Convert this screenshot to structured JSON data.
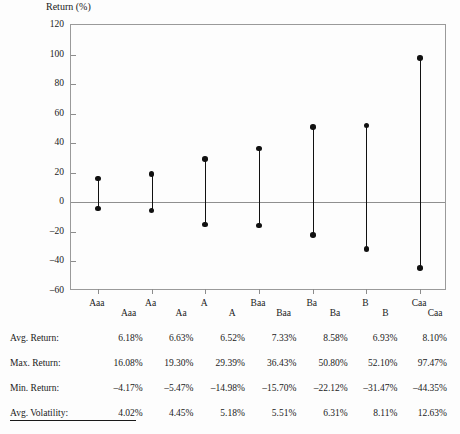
{
  "chart_data": {
    "type": "bar",
    "title": "Return (%)",
    "xlabel": "",
    "ylabel": "Return (%)",
    "ylim": [
      -60,
      120
    ],
    "yticks": [
      120,
      100,
      80,
      60,
      40,
      20,
      0,
      -20,
      -40,
      -60
    ],
    "grid": false,
    "legend": "none",
    "zero_line": true,
    "marker": "filled-circle",
    "series_description": "Vertical range bars from minimum return to maximum return per credit rating, endpoints marked with filled circles",
    "categories": [
      "Aaa",
      "Aa",
      "A",
      "Baa",
      "Ba",
      "B",
      "Caa"
    ],
    "series": [
      {
        "name": "Max. Return",
        "values": [
          16.08,
          19.3,
          29.39,
          36.43,
          50.8,
          52.1,
          97.47
        ]
      },
      {
        "name": "Min. Return",
        "values": [
          -4.17,
          -5.47,
          -14.98,
          -15.7,
          -22.12,
          -31.47,
          -44.35
        ]
      },
      {
        "name": "Avg. Return",
        "values": [
          6.18,
          6.63,
          6.52,
          7.33,
          8.58,
          6.93,
          8.1
        ]
      },
      {
        "name": "Avg. Volatility",
        "values": [
          4.02,
          4.45,
          5.18,
          5.51,
          6.31,
          8.11,
          12.63
        ]
      }
    ]
  },
  "table": {
    "header": [
      "",
      "Aaa",
      "Aa",
      "A",
      "Baa",
      "Ba",
      "B",
      "Caa"
    ],
    "rows": [
      {
        "label": "Avg. Return:",
        "values": [
          "6.18%",
          "6.63%",
          "6.52%",
          "7.33%",
          "8.58%",
          "6.93%",
          "8.10%"
        ]
      },
      {
        "label": "Max. Return:",
        "values": [
          "16.08%",
          "19.30%",
          "29.39%",
          "36.43%",
          "50.80%",
          "52.10%",
          "97.47%"
        ]
      },
      {
        "label": "Min. Return:",
        "values": [
          "–4.17%",
          "–5.47%",
          "–14.98%",
          "–15.70%",
          "–22.12%",
          "–31.47%",
          "–44.35%"
        ]
      },
      {
        "label": "Avg. Volatility:",
        "values": [
          "4.02%",
          "4.45%",
          "5.18%",
          "5.51%",
          "6.31%",
          "8.11%",
          "12.63%"
        ]
      }
    ]
  },
  "colors": {
    "marker": "#111111",
    "axis": "#9a9a9a",
    "zero_line": "#8f8f8f",
    "text": "#1a1a1a",
    "background": "#fdfdfd"
  }
}
